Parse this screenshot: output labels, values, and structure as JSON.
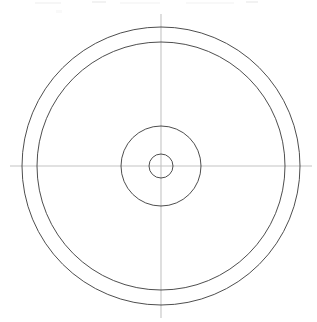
{
  "document": {
    "kind": "engineering-drawing",
    "view_label": "concentric-circles-plan-view",
    "background_color": "#ffffff",
    "canvas": {
      "width": 317,
      "height": 322
    }
  },
  "geometry": {
    "center": {
      "x": 161,
      "y": 166
    },
    "circles": [
      {
        "name": "outer-circle",
        "role": "outer-rim-edge",
        "cx": 161,
        "cy": 166,
        "r": 139,
        "stroke": "#3a3a3a",
        "stroke_width": 0.9,
        "fill": "none"
      },
      {
        "name": "second-circle",
        "role": "inner-rim-edge",
        "cx": 161,
        "cy": 166,
        "r": 124,
        "stroke": "#3a3a3a",
        "stroke_width": 0.9,
        "fill": "none"
      },
      {
        "name": "hub-circle",
        "role": "hub-outer-edge",
        "cx": 161,
        "cy": 166,
        "r": 40,
        "stroke": "#3a3a3a",
        "stroke_width": 0.9,
        "fill": "none"
      },
      {
        "name": "bore-circle",
        "role": "center-bore",
        "cx": 161,
        "cy": 166,
        "r": 12,
        "stroke": "#3a3a3a",
        "stroke_width": 0.9,
        "fill": "none"
      }
    ],
    "centerlines": [
      {
        "name": "horizontal-centerline",
        "orientation": "horizontal",
        "x1": 10,
        "y1": 166,
        "x2": 312,
        "y2": 166,
        "stroke": "#c4c4c4",
        "stroke_width": 1.1
      },
      {
        "name": "vertical-centerline",
        "orientation": "vertical",
        "x1": 161,
        "y1": 14,
        "x2": 161,
        "y2": 318,
        "stroke": "#c4c4c4",
        "stroke_width": 1.1
      }
    ]
  },
  "artifacts": {
    "top_edge_scan_marks": [
      {
        "name": "scan-mark-a",
        "x": 35,
        "y": 2,
        "width": 26,
        "height": 2,
        "opacity": 0.07
      },
      {
        "name": "scan-mark-b",
        "x": 92,
        "y": 1,
        "width": 14,
        "height": 2,
        "opacity": 0.1
      },
      {
        "name": "scan-mark-c",
        "x": 120,
        "y": 2,
        "width": 40,
        "height": 2,
        "opacity": 0.06
      },
      {
        "name": "scan-mark-d",
        "x": 186,
        "y": 2,
        "width": 48,
        "height": 2,
        "opacity": 0.06
      },
      {
        "name": "scan-mark-e",
        "x": 246,
        "y": 1,
        "width": 12,
        "height": 2,
        "opacity": 0.1
      },
      {
        "name": "scan-mark-f",
        "x": 56,
        "y": 10,
        "width": 6,
        "height": 3,
        "opacity": 0.05
      }
    ]
  },
  "colors": {
    "outline": "#3a3a3a",
    "centerline": "#c4c4c4",
    "background": "#ffffff"
  }
}
